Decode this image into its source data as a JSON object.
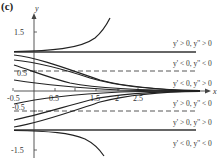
{
  "figure": {
    "label": "(c)",
    "axes": {
      "x_name": "x",
      "y_name": "y",
      "x_ticks": [
        "-0.5",
        "0.5",
        "1.5",
        "2",
        "2.5"
      ],
      "y_ticks": [
        "1.5",
        "0.5",
        "-0.5",
        "-1.5"
      ]
    },
    "reference_lines": [
      {
        "y": 1,
        "style": "solid"
      },
      {
        "y": 0.5,
        "style": "dashed"
      },
      {
        "y": -0.5,
        "style": "dashed"
      },
      {
        "y": -1,
        "style": "solid"
      }
    ],
    "region_labels": [
      "y' > 0, y'' > 0",
      "y' < 0, y'' < 0",
      "y' < 0, y'' > 0",
      "y' > 0, y'' < 0",
      "y' > 0, y'' > 0",
      "y' < 0, y'' < 0"
    ],
    "colors": {
      "curve": "#222222",
      "axis": "#444444",
      "text": "#333333"
    }
  }
}
